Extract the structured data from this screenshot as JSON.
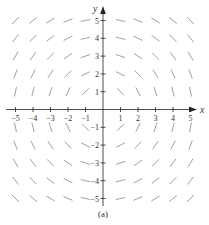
{
  "figure": {
    "caption": "(a)",
    "type": "slope-field",
    "equation_pattern": "dy/dx = -x/y",
    "x_axis": {
      "label": "x",
      "min": -5,
      "max": 5,
      "tick_labels": [
        "-5",
        "-4",
        "-3",
        "-2",
        "-1",
        "1",
        "2",
        "3",
        "4",
        "5"
      ]
    },
    "y_axis": {
      "label": "y",
      "min": -5,
      "max": 5,
      "tick_labels": [
        "5",
        "4",
        "3",
        "2",
        "1",
        "-1",
        "-2",
        "-3",
        "-4",
        "-5"
      ]
    },
    "grid_points": {
      "x_values": [
        -5,
        -4,
        -3,
        -2,
        -1,
        1,
        2,
        3,
        4,
        5
      ],
      "y_values": [
        -5,
        -4,
        -3,
        -2,
        -1,
        1,
        2,
        3,
        4,
        5
      ]
    },
    "segment_length": 9,
    "colors": {
      "axis": "#222222",
      "segment": "#777777",
      "text": "#333333"
    }
  },
  "layout": {
    "origin_x": 103,
    "origin_y": 109.5,
    "unit_x": 17.5,
    "unit_y": 17.8
  }
}
